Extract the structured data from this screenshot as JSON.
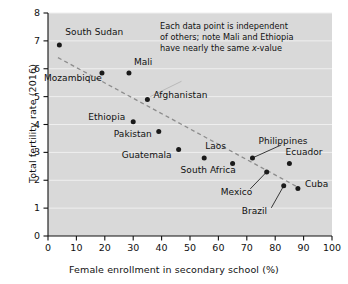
{
  "chart_data": {
    "type": "scatter",
    "title": "",
    "xlabel": "Female enrollment in secondary school (%)",
    "ylabel": "Total fertility rate (2016)",
    "xlim": [
      0,
      100
    ],
    "ylim": [
      0,
      8
    ],
    "xticks": [
      "0",
      "10",
      "20",
      "30",
      "40",
      "50",
      "60",
      "70",
      "80",
      "90",
      "100"
    ],
    "yticks": [
      "0",
      "1",
      "2",
      "3",
      "4",
      "5",
      "6",
      "7",
      "8"
    ],
    "grid": "horizontal",
    "legend": "none",
    "plot_background": "#d9d9d9",
    "point_color": "#1a1a1a",
    "trendline_color": "#8c8c8c",
    "points": [
      {
        "label": "South Sudan",
        "x": 4,
        "y": 6.85,
        "label_dx": 6,
        "label_dy": -13,
        "leader": false
      },
      {
        "label": "Mozambique",
        "x": 19,
        "y": 5.85,
        "label_dx": -58,
        "label_dy": 5,
        "leader": false
      },
      {
        "label": "Mali",
        "x": 28.5,
        "y": 5.85,
        "label_dx": 5,
        "label_dy": -11,
        "leader": false
      },
      {
        "label": "Afghanistan",
        "x": 35,
        "y": 4.9,
        "label_dx": 6,
        "label_dy": -4,
        "leader": false
      },
      {
        "label": "Ethiopia",
        "x": 30,
        "y": 4.1,
        "label_dx": -45,
        "label_dy": -5,
        "leader": false
      },
      {
        "label": "Pakistan",
        "x": 39,
        "y": 3.75,
        "label_dx": -45,
        "label_dy": 3,
        "leader": false
      },
      {
        "label": "Guatemala",
        "x": 46,
        "y": 3.1,
        "label_dx": -57,
        "label_dy": 5,
        "leader": false
      },
      {
        "label": "Laos",
        "x": 55,
        "y": 2.8,
        "label_dx": 1,
        "label_dy": -12,
        "leader": false
      },
      {
        "label": "South Africa",
        "x": 65,
        "y": 2.6,
        "label_dx": -52,
        "label_dy": 6,
        "leader": false
      },
      {
        "label": "Philippines",
        "x": 72,
        "y": 2.8,
        "label_dx": 6,
        "label_dy": -17,
        "leader": true
      },
      {
        "label": "Mexico",
        "x": 77,
        "y": 2.3,
        "label_dx": -46,
        "label_dy": 20,
        "leader": true
      },
      {
        "label": "Ecuador",
        "x": 85,
        "y": 2.6,
        "label_dx": -4,
        "label_dy": -12,
        "leader": false
      },
      {
        "label": "Brazil",
        "x": 83,
        "y": 1.8,
        "label_dx": -42,
        "label_dy": 25,
        "leader": true
      },
      {
        "label": "Cuba",
        "x": 88,
        "y": 1.7,
        "label_dx": 7,
        "label_dy": -5,
        "leader": false
      }
    ],
    "trendline": {
      "x1": 3.5,
      "y1": 6.4,
      "x2": 88,
      "y2": 1.75,
      "style": "dashed"
    },
    "annotation": {
      "lines": [
        "Each data point is independent",
        "of others; note Mali and Ethiopia",
        "have nearly the same x-value"
      ],
      "italic_token": "x",
      "callout": {
        "x1": 47,
        "y1": 5.55,
        "x2": 36,
        "y2": 5.0
      }
    }
  }
}
